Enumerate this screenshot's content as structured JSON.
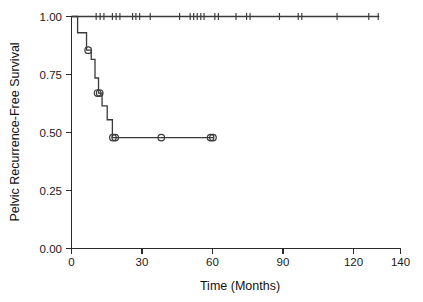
{
  "chart_data": {
    "type": "line",
    "title": "",
    "xlabel": "Time (Months)",
    "ylabel": "Pelvic Recurrence-Free Survival",
    "xlim": [
      0,
      140
    ],
    "ylim": [
      0,
      1.0
    ],
    "xticks": [
      0,
      30,
      60,
      90,
      120,
      140
    ],
    "xtick_labels": [
      "0",
      "30",
      "60",
      "90",
      "120",
      "140"
    ],
    "yticks": [
      0.0,
      0.25,
      0.5,
      0.75,
      1.0
    ],
    "ytick_labels": [
      "0.00",
      "0.25",
      "0.50",
      "0.75",
      "1.00"
    ],
    "grid": false,
    "legend": "none",
    "series": [
      {
        "name": "upper-curve",
        "marker": "tick",
        "step_points": [
          [
            0,
            1.0
          ],
          [
            131,
            1.0
          ]
        ],
        "censor_times": [
          10.5,
          12.2,
          13.8,
          17.4,
          19.0,
          20.6,
          26.0,
          27.4,
          29.0,
          33.5,
          46.0,
          50.5,
          52.0,
          53.5,
          55.0,
          56.4,
          61.0,
          62.5,
          70.0,
          74.5,
          76.0,
          88.5,
          96.5,
          98.0,
          113.0,
          126.5,
          130.5
        ]
      },
      {
        "name": "lower-curve",
        "marker": "circle",
        "step_points": [
          [
            0,
            1.0
          ],
          [
            2.6,
            1.0
          ],
          [
            2.6,
            0.93
          ],
          [
            6.4,
            0.93
          ],
          [
            6.4,
            0.855
          ],
          [
            8.4,
            0.855
          ],
          [
            8.4,
            0.815
          ],
          [
            10.0,
            0.815
          ],
          [
            10.0,
            0.735
          ],
          [
            11.5,
            0.735
          ],
          [
            11.5,
            0.67
          ],
          [
            13.0,
            0.67
          ],
          [
            13.0,
            0.615
          ],
          [
            15.2,
            0.615
          ],
          [
            15.2,
            0.555
          ],
          [
            17.4,
            0.555
          ],
          [
            17.4,
            0.478
          ],
          [
            60.6,
            0.478
          ]
        ],
        "censor_times": [
          7.1,
          11.1,
          12.0,
          17.6,
          18.6,
          38.2,
          59.2,
          60.2
        ],
        "censor_values": [
          0.855,
          0.67,
          0.67,
          0.478,
          0.478,
          0.478,
          0.478,
          0.478
        ]
      }
    ],
    "colors": {
      "curve": "#3a3a3a",
      "axis": "#2a2a2a",
      "background": "#ffffff"
    }
  },
  "axes": {
    "x_title": "Time (Months)",
    "y_title": "Pelvic Recurrence-Free Survival"
  }
}
